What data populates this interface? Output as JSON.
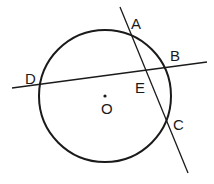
{
  "diagram": {
    "type": "circle-geometry",
    "circle": {
      "center_label": "O",
      "cx": 105,
      "cy": 96,
      "r": 66
    },
    "points": [
      {
        "label": "A",
        "x": 136,
        "y": 24
      },
      {
        "label": "B",
        "x": 175,
        "y": 56
      },
      {
        "label": "C",
        "x": 178,
        "y": 125
      },
      {
        "label": "D",
        "x": 31,
        "y": 79
      },
      {
        "label": "E",
        "x": 141,
        "y": 88
      },
      {
        "label": "O",
        "x": 107,
        "y": 109
      }
    ],
    "lines": [
      {
        "name": "line-DB",
        "x1": 12,
        "y1": 88,
        "x2": 207,
        "y2": 62
      },
      {
        "name": "line-AC",
        "x1": 120,
        "y1": 7,
        "x2": 188,
        "y2": 173
      }
    ],
    "colors": {
      "stroke": "#1a1a1a",
      "background": "#ffffff"
    }
  }
}
